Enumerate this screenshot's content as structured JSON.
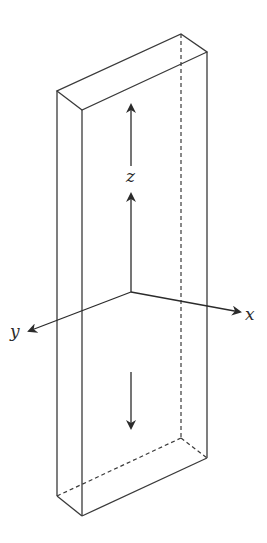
{
  "diagram": {
    "type": "3d-rectangular-bar-with-axes",
    "stroke_color": "#3a3a3a",
    "background": "#ffffff",
    "labels": {
      "x_axis": "x",
      "y_axis": "y",
      "z_axis": "z"
    },
    "arrows": {
      "upward": "force-up",
      "downward": "force-down"
    }
  }
}
